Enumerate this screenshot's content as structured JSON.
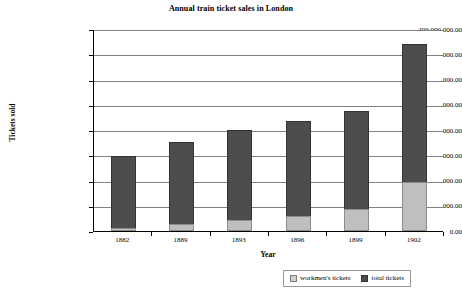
{
  "chart_data": {
    "type": "bar",
    "subtype": "stacked-column",
    "title": "Annual train ticket sales in London",
    "xlabel": "Year",
    "ylabel": "Tickets sold",
    "categories": [
      "1882",
      "1889",
      "1893",
      "1896",
      "1899",
      "1902"
    ],
    "series": [
      {
        "name": "workmen's tickets",
        "color": "#bfbfbf",
        "values": [
          6000000,
          14000000,
          22000000,
          30000000,
          44000000,
          97000000
        ]
      },
      {
        "name": "total tickets",
        "color": "#4d4d4d",
        "values": [
          148000000,
          176000000,
          200000000,
          218000000,
          238000000,
          371000000
        ]
      }
    ],
    "ylim": [
      0,
      400000000
    ],
    "ytick_values": [
      0,
      50000000,
      100000000,
      150000000,
      200000000,
      250000000,
      300000000,
      350000000,
      400000000
    ],
    "ytick_labels": [
      "0.00",
      "50,000,000.00",
      "100,000,000.00",
      "150,000,000.00",
      "200,000,000.00",
      "250,000,000.00",
      "300,000,000.00",
      "350,000,000.00",
      "400,000,000.00"
    ],
    "grid": "horizontal",
    "legend_position": "bottom-right",
    "legend": [
      "workmen's tickets",
      "total tickets"
    ]
  },
  "legend": {
    "entries": [
      {
        "label": "workmen's tickets",
        "swatch": "light-grey-swatch-icon"
      },
      {
        "label": "total tickets",
        "swatch": "dark-grey-swatch-icon"
      }
    ]
  }
}
